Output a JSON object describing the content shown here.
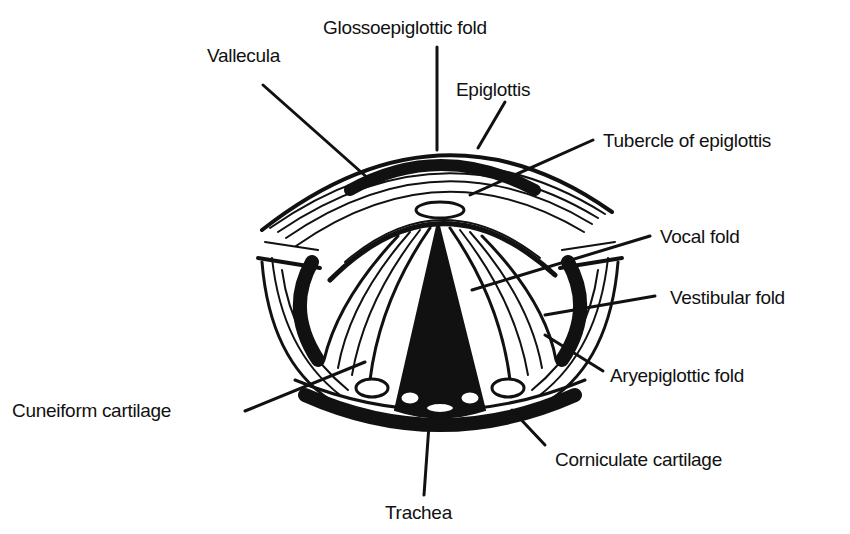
{
  "figure": {
    "labels": [
      {
        "id": "glossoepiglottic-fold",
        "text": "Glossoepiglottic fold"
      },
      {
        "id": "vallecula",
        "text": "Vallecula"
      },
      {
        "id": "epiglottis",
        "text": "Epiglottis"
      },
      {
        "id": "tubercle-of-epiglottis",
        "text": "Tubercle of epiglottis"
      },
      {
        "id": "vocal-fold",
        "text": "Vocal fold"
      },
      {
        "id": "vestibular-fold",
        "text": "Vestibular fold"
      },
      {
        "id": "aryepiglottic-fold",
        "text": "Aryepiglottic fold"
      },
      {
        "id": "cuneiform-cartilage",
        "text": "Cuneiform cartilage"
      },
      {
        "id": "corniculate-cartilage",
        "text": "Corniculate cartilage"
      },
      {
        "id": "trachea",
        "text": "Trachea"
      }
    ]
  }
}
